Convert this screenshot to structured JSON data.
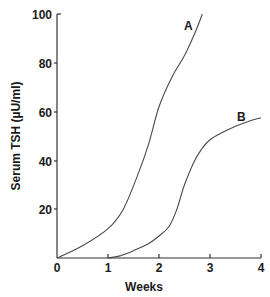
{
  "chart_data": {
    "type": "line",
    "title": "",
    "xlabel": "Weeks",
    "ylabel": "Serum TSH (µU/ml)",
    "xlim": [
      0,
      4
    ],
    "ylim": [
      0,
      100
    ],
    "x_ticks": [
      "0",
      "1",
      "2",
      "3",
      "4"
    ],
    "y_ticks": [
      "20",
      "40",
      "60",
      "80",
      "100"
    ],
    "grid": false,
    "legend": "inline labels at curve ends",
    "series": [
      {
        "name": "A",
        "points": [
          [
            0,
            0
          ],
          [
            0.5,
            5
          ],
          [
            1,
            12
          ],
          [
            1.3,
            20
          ],
          [
            1.6,
            35
          ],
          [
            1.8,
            47
          ],
          [
            2,
            62
          ],
          [
            2.25,
            74
          ],
          [
            2.5,
            83
          ],
          [
            2.7,
            92
          ],
          [
            2.85,
            100
          ]
        ]
      },
      {
        "name": "B",
        "points": [
          [
            1,
            0
          ],
          [
            1.25,
            1
          ],
          [
            1.5,
            3
          ],
          [
            1.8,
            6
          ],
          [
            2,
            9
          ],
          [
            2.2,
            13
          ],
          [
            2.35,
            20
          ],
          [
            2.5,
            30
          ],
          [
            2.7,
            40
          ],
          [
            2.85,
            45
          ],
          [
            3,
            48.5
          ],
          [
            3.25,
            51.5
          ],
          [
            3.5,
            54
          ],
          [
            3.75,
            56
          ],
          [
            4,
            57.5
          ]
        ]
      }
    ],
    "colors": {
      "line": "#4a4a4a",
      "axis": "#333333",
      "text": "#1a1a1a"
    }
  }
}
